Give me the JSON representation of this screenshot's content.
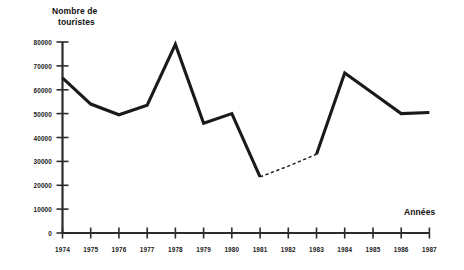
{
  "chart_data": {
    "type": "line",
    "title": "",
    "xlabel": "Années",
    "ylabel": "Nombre de touristes",
    "ylabel_line1": "Nombre de",
    "ylabel_line2": "touristes",
    "categories": [
      "1974",
      "1975",
      "1976",
      "1977",
      "1978",
      "1979",
      "1980",
      "1981",
      "1982",
      "1983",
      "1984",
      "1985",
      "1986",
      "1987"
    ],
    "x": [
      1974,
      1975,
      1976,
      1977,
      1978,
      1979,
      1980,
      1981,
      1982,
      1983,
      1984,
      1985,
      1986,
      1987
    ],
    "values": [
      65000,
      54000,
      49500,
      53500,
      79000,
      46000,
      50000,
      23500,
      28000,
      33000,
      67000,
      58500,
      50000,
      50500
    ],
    "series": [
      {
        "name": "Nombre de touristes",
        "style": "solid",
        "x": [
          1974,
          1975,
          1976,
          1977,
          1978,
          1979,
          1980,
          1981
        ],
        "values": [
          65000,
          54000,
          49500,
          53500,
          79000,
          46000,
          50000,
          23500
        ]
      },
      {
        "name": "Nombre de touristes (estimation)",
        "style": "dashed",
        "x": [
          1981,
          1982,
          1983
        ],
        "values": [
          23500,
          28000,
          33000
        ]
      },
      {
        "name": "Nombre de touristes (suite)",
        "style": "solid",
        "x": [
          1983,
          1984,
          1985,
          1986,
          1987
        ],
        "values": [
          33000,
          67000,
          58500,
          50000,
          50500
        ]
      }
    ],
    "ylim": [
      0,
      80000
    ],
    "xlim": [
      1974,
      1987
    ],
    "ytick_labels": [
      "0",
      "10000",
      "20000",
      "30000",
      "40000",
      "50000",
      "60000",
      "70000",
      "80000"
    ],
    "ytick_values": [
      0,
      10000,
      20000,
      30000,
      40000,
      50000,
      60000,
      70000,
      80000
    ],
    "xtick_labels": [
      "1974",
      "1975",
      "1976",
      "1977",
      "1978",
      "1979",
      "1980",
      "1981",
      "1982",
      "1983",
      "1984",
      "1985",
      "1986",
      "1987"
    ],
    "grid": false,
    "legend": "none",
    "line_color": "#1a1a1a",
    "axis_color": "#2b2b2b",
    "background_color": "#ffffff"
  }
}
